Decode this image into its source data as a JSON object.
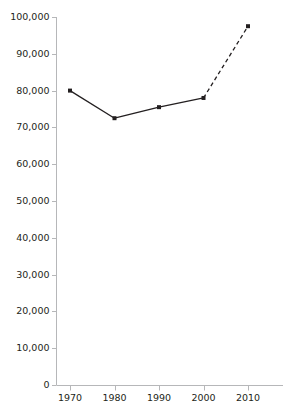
{
  "chart_data": {
    "type": "line",
    "title": "",
    "subtitle": "",
    "xlabel": "",
    "ylabel": "",
    "categories": [
      1970,
      1980,
      1990,
      2000,
      2010
    ],
    "x": [
      1970,
      1980,
      1990,
      2000,
      2010
    ],
    "values": [
      80000,
      72500,
      75500,
      78000,
      97500
    ],
    "series": [
      {
        "name": "",
        "values": [
          80000,
          72500,
          75500,
          78000,
          97500
        ],
        "marker": "square",
        "color": "#231f20",
        "segment_styles": [
          "solid",
          "solid",
          "solid",
          "dashed"
        ]
      }
    ],
    "annotations": [
      {
        "text": "2000-2010 segment drawn dashed (projected)",
        "x_from": 2000,
        "x_to": 2010
      }
    ],
    "ylim": [
      0,
      100000
    ],
    "ytick_values": [
      0,
      10000,
      20000,
      30000,
      40000,
      50000,
      60000,
      70000,
      80000,
      90000,
      100000
    ],
    "ytick_labels": [
      "0",
      "10,000",
      "20,000",
      "30,000",
      "40,000",
      "50,000",
      "60,000",
      "70,000",
      "80,000",
      "90,000",
      "100,000"
    ],
    "xlim": [
      1965,
      2015
    ],
    "xtick_values": [
      1970,
      1980,
      1990,
      2000,
      2010
    ],
    "xtick_labels": [
      "1970",
      "1980",
      "1990",
      "2000",
      "2010"
    ],
    "grid": false,
    "legend": null,
    "legend_position": "none",
    "axis_color": "#b6b7b9",
    "line_color": "#231f20",
    "marker_color": "#231f20",
    "background": "#ffffff"
  }
}
